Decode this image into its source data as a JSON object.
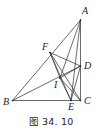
{
  "figure": {
    "caption": "图 34. 10",
    "caption_prefix": "图",
    "caption_number": "34. 10",
    "ink_color": "#3a3a3a",
    "label_color": "#1c1c1c",
    "background_color": "#ffffff",
    "canvas": {
      "width": 102,
      "height": 138
    },
    "diagram_box": {
      "width": 102,
      "height": 116
    }
  },
  "geometry": {
    "type": "euclidean-plane-figure",
    "shape": "triangle-with-cevians",
    "points": [
      {
        "id": "A",
        "label": "A",
        "x": 80.5,
        "y": 20.0,
        "label_x": 82.0,
        "label_y": 6.0
      },
      {
        "id": "B",
        "label": "B",
        "x": 12.5,
        "y": 100.5,
        "label_x": 3.0,
        "label_y": 97.0
      },
      {
        "id": "C",
        "label": "C",
        "x": 80.5,
        "y": 100.5,
        "label_x": 84.0,
        "label_y": 96.0
      },
      {
        "id": "D",
        "label": "D",
        "x": 80.5,
        "y": 66.0,
        "label_x": 84.0,
        "label_y": 61.0
      },
      {
        "id": "E",
        "label": "E",
        "x": 71.0,
        "y": 100.5,
        "label_x": 68.0,
        "label_y": 102.0
      },
      {
        "id": "F",
        "label": "F",
        "x": 50.0,
        "y": 52.5,
        "label_x": 42.0,
        "label_y": 42.0
      },
      {
        "id": "I",
        "label": "I",
        "x": 60.0,
        "y": 78.0,
        "label_x": 54.0,
        "label_y": 80.0
      }
    ],
    "segments": [
      {
        "id": "AB",
        "from": "A",
        "to": "B",
        "name": "side-ab"
      },
      {
        "id": "BC",
        "from": "B",
        "to": "C",
        "name": "side-bc"
      },
      {
        "id": "AC",
        "from": "A",
        "to": "C",
        "name": "side-ac"
      },
      {
        "id": "AE",
        "from": "A",
        "to": "E",
        "name": "cevian-ae"
      },
      {
        "id": "AI",
        "from": "A",
        "to": "I",
        "name": "segment-ai"
      },
      {
        "id": "BD",
        "from": "B",
        "to": "D",
        "name": "cevian-bd"
      },
      {
        "id": "FC",
        "from": "F",
        "to": "C",
        "name": "segment-fc"
      },
      {
        "id": "FD",
        "from": "F",
        "to": "D",
        "name": "segment-fd"
      },
      {
        "id": "FE",
        "from": "F",
        "to": "E",
        "name": "segment-fe"
      },
      {
        "id": "FI",
        "from": "F",
        "to": "I",
        "name": "segment-fi"
      },
      {
        "id": "ID",
        "from": "I",
        "to": "D",
        "name": "segment-id"
      },
      {
        "id": "IE",
        "from": "I",
        "to": "E",
        "name": "segment-ie"
      },
      {
        "id": "IC",
        "from": "I",
        "to": "C",
        "name": "segment-ic"
      },
      {
        "id": "DE",
        "from": "D",
        "to": "E",
        "name": "segment-de"
      }
    ]
  }
}
